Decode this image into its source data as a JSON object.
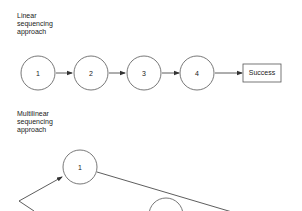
{
  "linear": {
    "title_lines": [
      "Linear",
      "sequencing",
      "approach"
    ],
    "nodes": [
      "1",
      "2",
      "3",
      "4"
    ],
    "end_label": "Success"
  },
  "multilinear": {
    "title_lines": [
      "Multilinear",
      "sequencing",
      "approach"
    ],
    "nodes": [
      "1"
    ]
  },
  "colors": {
    "stroke": "#555555",
    "text": "#222222",
    "background": "#ffffff"
  }
}
